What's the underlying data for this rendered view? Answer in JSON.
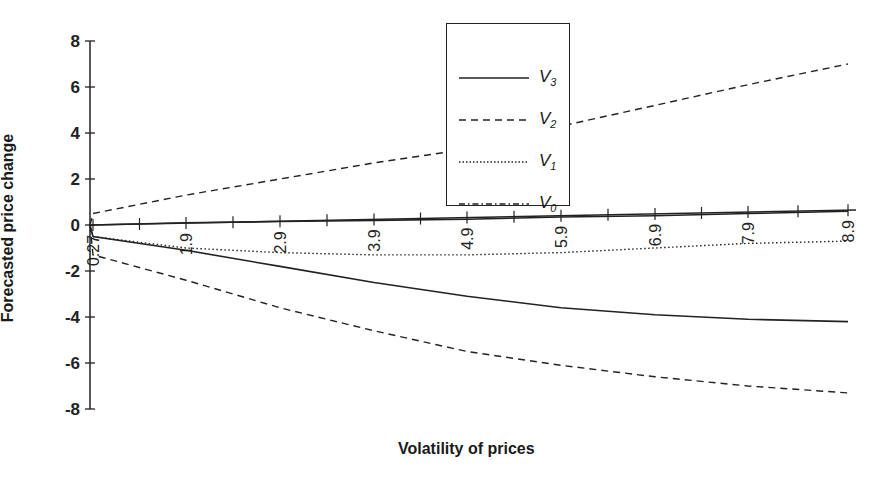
{
  "chart_data": {
    "type": "line",
    "title": "",
    "xlabel": "Volatility of prices",
    "ylabel": "Forecasted price change",
    "x": [
      0.27,
      1.9,
      2.9,
      3.9,
      4.9,
      5.9,
      6.9,
      7.9,
      8.9
    ],
    "x_tick_labels": [
      "0.27",
      "1.9",
      "2.9",
      "3.9",
      "4.9",
      "5.9",
      "6.9",
      "7.9",
      "8.9"
    ],
    "y_ticks": [
      8,
      6,
      4,
      2,
      0,
      -2,
      -4,
      -6,
      -8
    ],
    "ylim": [
      -8,
      8
    ],
    "grid": false,
    "legend_position": "top-center",
    "legend": [
      "V3",
      "V2",
      "V1",
      "V0"
    ],
    "series": [
      {
        "name": "V3 (upper, solid)",
        "style": "solid",
        "values": [
          0.0,
          0.1,
          0.15,
          0.2,
          0.25,
          0.35,
          0.4,
          0.5,
          0.6
        ]
      },
      {
        "name": "V3 (lower, solid)",
        "style": "solid",
        "values": [
          -0.5,
          -1.1,
          -1.8,
          -2.5,
          -3.1,
          -3.6,
          -3.9,
          -4.1,
          -4.2
        ]
      },
      {
        "name": "V2 (upper, dashed)",
        "style": "dashed",
        "values": [
          0.5,
          1.3,
          2.0,
          2.7,
          3.3,
          4.3,
          5.2,
          6.1,
          7.0
        ]
      },
      {
        "name": "V2 (lower, dashed)",
        "style": "dashed",
        "values": [
          -1.3,
          -2.4,
          -3.6,
          -4.6,
          -5.5,
          -6.1,
          -6.6,
          -7.0,
          -7.3
        ]
      },
      {
        "name": "V1 (dotted)",
        "style": "dotted",
        "values": [
          -0.5,
          -1.0,
          -1.2,
          -1.3,
          -1.3,
          -1.2,
          -1.0,
          -0.8,
          -0.7
        ]
      }
    ]
  },
  "labels": {
    "xlabel": "Volatility of prices",
    "ylabel": "Forecasted price change",
    "legend": [
      {
        "base": "V",
        "sub": "3",
        "style": "solid"
      },
      {
        "base": "V",
        "sub": "2",
        "style": "dashed"
      },
      {
        "base": "V",
        "sub": "1",
        "style": "dotted"
      },
      {
        "base": "V",
        "sub": "0",
        "style": "dashdot"
      }
    ]
  }
}
